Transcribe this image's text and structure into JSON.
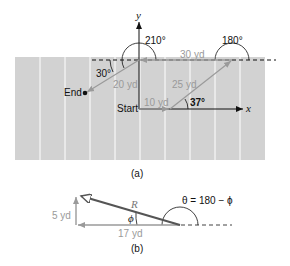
{
  "figure_a": {
    "caption": "(a)",
    "axis_x_label": "x",
    "axis_y_label": "y",
    "start_label": "Start",
    "end_label": "End",
    "vectors": [
      {
        "label": "10 yd",
        "angle_label": ""
      },
      {
        "label": "25 yd",
        "angle_label": "37°"
      },
      {
        "label": "30 yd",
        "angle_label": "180°"
      },
      {
        "label": "20 yd",
        "angle_label": "210°"
      }
    ],
    "angle_30_label": "30°",
    "colors": {
      "field": "#d2d2d2",
      "field_lines": "#ffffff",
      "vector": "#a0a0a0",
      "axis": "#111111"
    }
  },
  "figure_b": {
    "caption": "(b)",
    "resultant_label": "R",
    "phi_label": "ϕ",
    "theta_label": "θ = 180 − ϕ",
    "vertical_label": "5 yd",
    "horizontal_label": "17 yd",
    "colors": {
      "resultant": "#555555",
      "component": "#a0a0a0"
    }
  }
}
